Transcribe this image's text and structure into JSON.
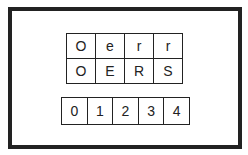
{
  "diagram": {
    "top_grid": {
      "rows": [
        [
          "O",
          "e",
          "r",
          "r"
        ],
        [
          "O",
          "E",
          "R",
          "S"
        ]
      ]
    },
    "bottom_grid": {
      "cells": [
        "0",
        "1",
        "2",
        "3",
        "4"
      ]
    }
  },
  "colors": {
    "border": "#222222",
    "background": "#ffffff"
  }
}
